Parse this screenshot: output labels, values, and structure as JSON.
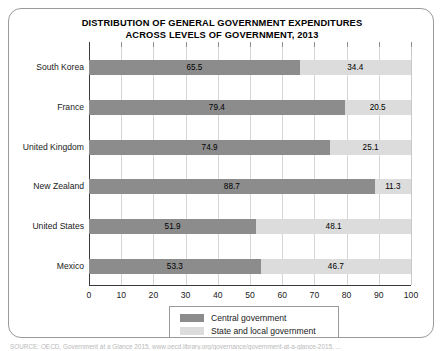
{
  "chart_data": {
    "type": "bar",
    "orientation": "horizontal",
    "stacked": true,
    "title": "DISTRIBUTION OF GENERAL GOVERNMENT EXPENDITURES ACROSS LEVELS OF GOVERNMENT, 2013",
    "title_lines": [
      "DISTRIBUTION OF GENERAL GOVERNMENT EXPENDITURES",
      "ACROSS LEVELS OF GOVERNMENT, 2013"
    ],
    "categories": [
      "South Korea",
      "France",
      "United Kingdom",
      "New Zealand",
      "United States",
      "Mexico"
    ],
    "series": [
      {
        "name": "Central government",
        "color": "#8c8c8c",
        "values": [
          65.5,
          79.4,
          74.9,
          88.7,
          51.9,
          53.3
        ]
      },
      {
        "name": "State and local government",
        "color": "#dcdcdc",
        "values": [
          34.4,
          20.5,
          25.1,
          11.3,
          48.1,
          46.7
        ]
      }
    ],
    "xlabel": "",
    "ylabel": "",
    "xlim": [
      0,
      100
    ],
    "xticks": [
      0,
      10,
      20,
      30,
      40,
      50,
      60,
      70,
      80,
      90,
      100
    ],
    "xtick_labels": [
      "0",
      "10",
      "20",
      "30",
      "40",
      "50",
      "60",
      "70",
      "80",
      "90",
      "100"
    ],
    "grid": true,
    "grid_axis": "x",
    "legend_position": "bottom-center"
  },
  "legend": {
    "items": [
      {
        "label": "Central government"
      },
      {
        "label": "State and local government"
      }
    ]
  },
  "source": {
    "note": "SOURCE: OECD, Government at a Glance 2015, www.oecd.library.org/governance/government-at-a-glance-2015, ..."
  },
  "colors": {
    "central": "#8c8c8c",
    "local": "#dcdcdc",
    "axis": "#3a3a3a",
    "grid": "#d6d6d6",
    "border": "#9a9a9a",
    "background": "#ffffff"
  }
}
